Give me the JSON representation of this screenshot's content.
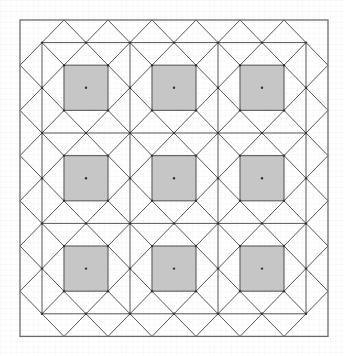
{
  "diagram": {
    "title": "",
    "colors": {
      "background": "#ffffff",
      "graph_paper_line": "#ececec",
      "pattern_line": "#555555",
      "tile_fill": "#c6c6c6",
      "tile_stroke": "#666666",
      "node": "#333333"
    },
    "lattice": {
      "origin_x": 20,
      "origin_y": 20,
      "step_u": 22,
      "step_v": 22.6,
      "max_u": 14,
      "max_v": 14
    },
    "outer_border": {
      "u0": 0,
      "v0": 0,
      "u1": 14,
      "v1": 14
    },
    "inner_frame": {
      "u0": 1,
      "v0": 1,
      "u1": 13,
      "v1": 13
    },
    "block_lines": {
      "vertical_u": [
        1,
        5,
        9,
        13
      ],
      "horizontal_v": [
        1,
        5,
        9,
        13
      ]
    },
    "blocks": {
      "rows": 3,
      "cols": 3,
      "centers": [
        3,
        7,
        11
      ],
      "tile_half_size": 1
    },
    "grid_paper_spacing": 5.5
  }
}
